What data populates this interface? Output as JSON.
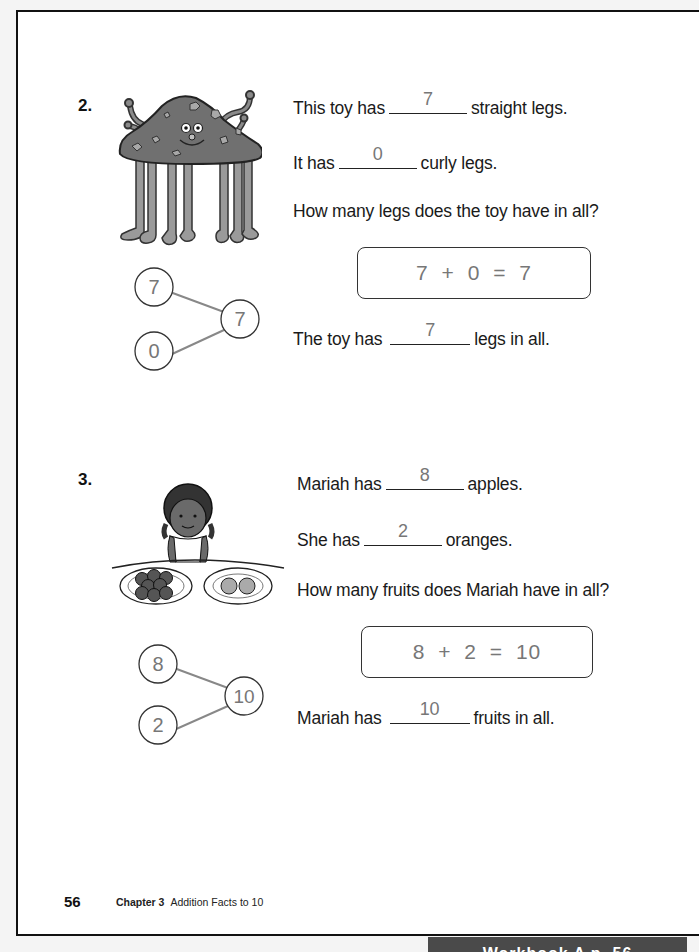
{
  "page": {
    "number": "56",
    "chapter_label": "Chapter 3",
    "chapter_title": "Addition Facts to 10",
    "banner": "Workbook A p. 56"
  },
  "problems": [
    {
      "number": "2.",
      "illustration": "toy-monster-with-legs",
      "line1": {
        "before": "This toy has",
        "answer": "7",
        "after": "straight legs."
      },
      "line2": {
        "before": "It has",
        "answer": "0",
        "after": "curly legs."
      },
      "question": "How many legs does the toy have in all?",
      "equation": "7 + 0 = 7",
      "number_bond": {
        "part1": "7",
        "part2": "0",
        "whole": "7"
      },
      "conclusion": {
        "before": "The toy has",
        "answer": "7",
        "after": "legs in all."
      }
    },
    {
      "number": "3.",
      "illustration": "girl-with-fruit-plates",
      "line1": {
        "before": "Mariah has",
        "answer": "8",
        "after": "apples."
      },
      "line2": {
        "before": "She has",
        "answer": "2",
        "after": "oranges."
      },
      "question": "How many fruits does Mariah have in all?",
      "equation": "8 + 2 = 10",
      "number_bond": {
        "part1": "8",
        "part2": "2",
        "whole": "10"
      },
      "conclusion": {
        "before": "Mariah has",
        "answer": "10",
        "after": "fruits in all."
      }
    }
  ],
  "colors": {
    "answer_gray": "#777777",
    "text": "#1a1a1a",
    "banner_bg": "#4a4a4a"
  }
}
